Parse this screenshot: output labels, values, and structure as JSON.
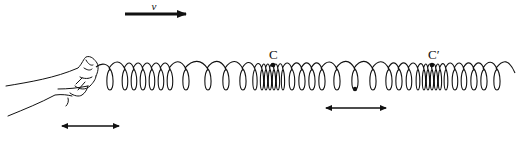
{
  "diagram": {
    "colors": {
      "ink": "#111111",
      "background": "#ffffff"
    },
    "velocity_arrow": {
      "label": "v",
      "x1": 125,
      "y1": 14,
      "x2": 186,
      "y2": 14,
      "direction": "right"
    },
    "labels": [
      {
        "id": "C",
        "text": "C",
        "x": 269,
        "y": 50
      },
      {
        "id": "C-prime",
        "text": "C′",
        "x": 428,
        "y": 50
      }
    ],
    "compression_points": [
      {
        "label": "C",
        "x": 273,
        "y": 65
      },
      {
        "label": "C′",
        "x": 432,
        "y": 65
      }
    ],
    "marked_point": {
      "x": 355,
      "y": 90
    },
    "oscillation_arrows": [
      {
        "id": "hand-oscillation",
        "x1": 62,
        "x2": 119,
        "y": 126
      },
      {
        "id": "particle-oscillation",
        "x1": 326,
        "x2": 386,
        "y": 108
      }
    ],
    "spring": {
      "start_x": 100,
      "end_x": 515,
      "top_y": 65,
      "bottom_y": 90,
      "coil_x_positions": [
        110,
        125,
        134,
        143,
        152,
        161,
        170,
        186,
        208,
        226,
        243,
        255,
        262,
        266,
        270,
        274,
        278,
        283,
        292,
        302,
        312,
        322,
        337,
        355,
        373,
        389,
        399,
        409,
        418,
        424,
        428,
        432,
        436,
        440,
        446,
        455,
        464,
        474,
        484,
        497
      ]
    },
    "hand": {
      "description": "hand gripping left end of spring"
    }
  }
}
